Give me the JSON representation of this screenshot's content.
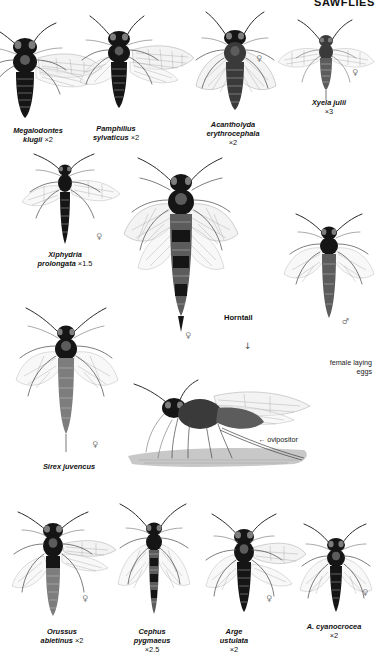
{
  "plate": {
    "header": "SAWFLIES",
    "page_kind": "field-guide-plate"
  },
  "symbols": {
    "female": "♀",
    "male": "♂",
    "arrow_down": "↓",
    "arrow_left": "←"
  },
  "rows": [
    {
      "name": "row-1",
      "figures": [
        {
          "id": "megalodontes-klugii",
          "species": "Megalodontes",
          "species2": "klugii",
          "magnification": "×2",
          "sex": "",
          "caption_x": 2,
          "caption_y": 126,
          "caption_w": 72
        },
        {
          "id": "pamphilius-sylvaticus",
          "species": "Pamphilius",
          "species2": "sylvaticus",
          "magnification": "×2",
          "sex": "",
          "caption_x": 72,
          "caption_y": 124,
          "caption_w": 88
        },
        {
          "id": "acantholyda-erythrocephala",
          "species": "Acantholyda",
          "species2": "erythrocephala",
          "magnification": "×2",
          "sex": "♀",
          "caption_x": 186,
          "caption_y": 120,
          "caption_w": 94
        },
        {
          "id": "xyela-julii",
          "species": "Xyela julii",
          "species2": "",
          "magnification": "×3",
          "sex": "♀",
          "caption_x": 288,
          "caption_y": 98,
          "caption_w": 82
        }
      ]
    },
    {
      "name": "row-2",
      "figures": [
        {
          "id": "xiphydria-prolongata",
          "species": "Xiphydria",
          "species2": "prolongata",
          "magnification": "×1.5",
          "sex": "♀",
          "caption_x": 10,
          "caption_y": 250,
          "caption_w": 110
        },
        {
          "id": "horntail",
          "species": "Horntail",
          "species2": "",
          "magnification": "",
          "sex": "♂",
          "caption_x": 224,
          "caption_y": 313,
          "caption_w": 60
        },
        {
          "id": "sirex-juvencus",
          "species": "Sirex juvencus",
          "species2": "",
          "magnification": "",
          "sex": "♀",
          "caption_x": 14,
          "caption_y": 462,
          "caption_w": 110
        }
      ]
    },
    {
      "name": "row-3-egg-laying",
      "figures": [
        {
          "id": "female-laying-eggs",
          "species": "",
          "species2": "",
          "magnification": "",
          "sex": "",
          "caption_x": 0,
          "caption_y": 0,
          "caption_w": 0
        }
      ]
    },
    {
      "name": "row-4",
      "figures": [
        {
          "id": "orussus-abietinus",
          "species": "Orussus",
          "species2": "abietinus",
          "magnification": "×2",
          "sex": "♀",
          "caption_x": 16,
          "caption_y": 627,
          "caption_w": 92
        },
        {
          "id": "cephus-pygmaeus",
          "species": "Cephus",
          "species2": "pygmaeus",
          "magnification": "×2.5",
          "sex": "",
          "caption_x": 110,
          "caption_y": 627,
          "caption_w": 84
        },
        {
          "id": "arge-ustulata",
          "species": "Arge",
          "species2": "ustulata",
          "magnification": "×2",
          "sex": "♀",
          "caption_x": 196,
          "caption_y": 627,
          "caption_w": 76
        },
        {
          "id": "a-cyanocrocea",
          "species": "A. cyanocrocea",
          "species2": "",
          "magnification": "×2",
          "sex": "♀",
          "caption_x": 288,
          "caption_y": 622,
          "caption_w": 92
        }
      ]
    }
  ],
  "annotations": {
    "female_laying_eggs_line1": "female laying",
    "female_laying_eggs_line2": "eggs",
    "ovipositor": "← ovipositor"
  }
}
